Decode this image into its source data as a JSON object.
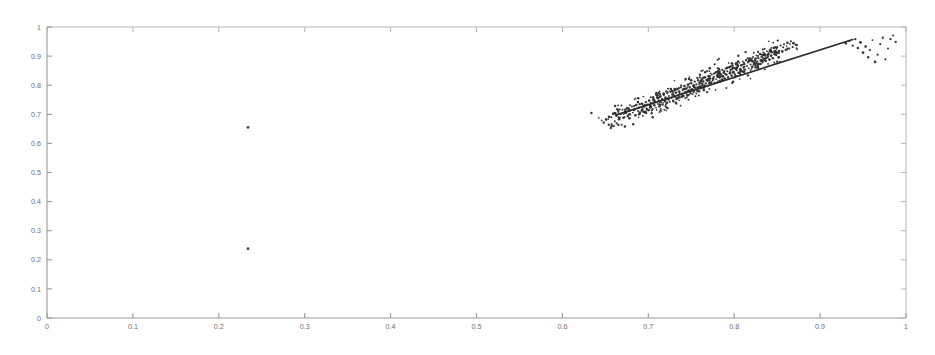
{
  "chart_data": {
    "type": "scatter",
    "title": "",
    "subtitle": "",
    "xlabel": "",
    "ylabel": "",
    "xlim": [
      0,
      1
    ],
    "ylim": [
      0,
      1
    ],
    "grid": false,
    "legend": null,
    "x_ticks": [
      0,
      0.1,
      0.2,
      0.3,
      0.4,
      0.5,
      0.6,
      0.7,
      0.8,
      0.9,
      1
    ],
    "y_ticks": [
      0,
      0.1,
      0.2,
      0.3,
      0.4,
      0.5,
      0.6,
      0.7,
      0.8,
      0.9,
      1
    ],
    "x_tick_labels": [
      "0",
      "0.1",
      "0.2",
      "0.3",
      "0.4",
      "0.5",
      "0.6",
      "0.7",
      "0.8",
      "0.9",
      "1"
    ],
    "y_tick_labels": [
      "0",
      "0.1",
      "0.2",
      "0.3",
      "0.4",
      "0.5",
      "0.6",
      "0.7",
      "0.8",
      "0.9",
      "1"
    ],
    "marker_color": "#333333",
    "line_color": "#2a2a2a",
    "axis_color": "#9a9a9a",
    "background_color": "#ffffff",
    "fit_line": {
      "name": "regression-line",
      "x0": 0.662,
      "y0": 0.697,
      "x1": 0.938,
      "y1": 0.957,
      "slope": 0.942,
      "intercept": 0.073
    },
    "series": [
      {
        "name": "main-cluster",
        "points": [
          [
            0.648,
            0.672
          ],
          [
            0.651,
            0.681
          ],
          [
            0.654,
            0.664
          ],
          [
            0.657,
            0.69
          ],
          [
            0.659,
            0.702
          ],
          [
            0.661,
            0.676
          ],
          [
            0.663,
            0.694
          ],
          [
            0.665,
            0.709
          ],
          [
            0.666,
            0.683
          ],
          [
            0.668,
            0.701
          ],
          [
            0.67,
            0.716
          ],
          [
            0.671,
            0.688
          ],
          [
            0.673,
            0.705
          ],
          [
            0.675,
            0.722
          ],
          [
            0.676,
            0.694
          ],
          [
            0.678,
            0.712
          ],
          [
            0.679,
            0.7
          ],
          [
            0.681,
            0.727
          ],
          [
            0.682,
            0.706
          ],
          [
            0.684,
            0.718
          ],
          [
            0.685,
            0.697
          ],
          [
            0.686,
            0.732
          ],
          [
            0.688,
            0.711
          ],
          [
            0.689,
            0.723
          ],
          [
            0.69,
            0.703
          ],
          [
            0.692,
            0.737
          ],
          [
            0.693,
            0.716
          ],
          [
            0.694,
            0.728
          ],
          [
            0.696,
            0.708
          ],
          [
            0.697,
            0.742
          ],
          [
            0.698,
            0.721
          ],
          [
            0.699,
            0.733
          ],
          [
            0.7,
            0.713
          ],
          [
            0.701,
            0.747
          ],
          [
            0.703,
            0.726
          ],
          [
            0.704,
            0.738
          ],
          [
            0.705,
            0.718
          ],
          [
            0.706,
            0.752
          ],
          [
            0.707,
            0.731
          ],
          [
            0.708,
            0.743
          ],
          [
            0.709,
            0.723
          ],
          [
            0.71,
            0.757
          ],
          [
            0.711,
            0.736
          ],
          [
            0.712,
            0.748
          ],
          [
            0.713,
            0.728
          ],
          [
            0.714,
            0.762
          ],
          [
            0.715,
            0.741
          ],
          [
            0.716,
            0.753
          ],
          [
            0.717,
            0.733
          ],
          [
            0.718,
            0.767
          ],
          [
            0.719,
            0.746
          ],
          [
            0.72,
            0.758
          ],
          [
            0.721,
            0.738
          ],
          [
            0.722,
            0.772
          ],
          [
            0.723,
            0.751
          ],
          [
            0.724,
            0.763
          ],
          [
            0.725,
            0.743
          ],
          [
            0.726,
            0.777
          ],
          [
            0.727,
            0.756
          ],
          [
            0.728,
            0.768
          ],
          [
            0.729,
            0.748
          ],
          [
            0.73,
            0.782
          ],
          [
            0.731,
            0.761
          ],
          [
            0.732,
            0.773
          ],
          [
            0.733,
            0.753
          ],
          [
            0.734,
            0.787
          ],
          [
            0.735,
            0.766
          ],
          [
            0.736,
            0.778
          ],
          [
            0.737,
            0.758
          ],
          [
            0.738,
            0.792
          ],
          [
            0.739,
            0.771
          ],
          [
            0.74,
            0.783
          ],
          [
            0.741,
            0.763
          ],
          [
            0.742,
            0.797
          ],
          [
            0.743,
            0.776
          ],
          [
            0.744,
            0.788
          ],
          [
            0.745,
            0.768
          ],
          [
            0.746,
            0.802
          ],
          [
            0.747,
            0.781
          ],
          [
            0.748,
            0.793
          ],
          [
            0.749,
            0.773
          ],
          [
            0.75,
            0.807
          ],
          [
            0.751,
            0.786
          ],
          [
            0.752,
            0.798
          ],
          [
            0.753,
            0.778
          ],
          [
            0.754,
            0.812
          ],
          [
            0.755,
            0.791
          ],
          [
            0.756,
            0.803
          ],
          [
            0.757,
            0.783
          ],
          [
            0.758,
            0.817
          ],
          [
            0.759,
            0.796
          ],
          [
            0.76,
            0.808
          ],
          [
            0.761,
            0.788
          ],
          [
            0.762,
            0.822
          ],
          [
            0.763,
            0.801
          ],
          [
            0.764,
            0.813
          ],
          [
            0.765,
            0.793
          ],
          [
            0.766,
            0.827
          ],
          [
            0.767,
            0.806
          ],
          [
            0.768,
            0.818
          ],
          [
            0.769,
            0.798
          ],
          [
            0.77,
            0.832
          ],
          [
            0.771,
            0.811
          ],
          [
            0.772,
            0.823
          ],
          [
            0.773,
            0.803
          ],
          [
            0.774,
            0.837
          ],
          [
            0.775,
            0.816
          ],
          [
            0.776,
            0.828
          ],
          [
            0.777,
            0.808
          ],
          [
            0.778,
            0.842
          ],
          [
            0.779,
            0.821
          ],
          [
            0.78,
            0.833
          ],
          [
            0.781,
            0.813
          ],
          [
            0.782,
            0.847
          ],
          [
            0.783,
            0.826
          ],
          [
            0.784,
            0.838
          ],
          [
            0.785,
            0.818
          ],
          [
            0.786,
            0.852
          ],
          [
            0.787,
            0.831
          ],
          [
            0.788,
            0.843
          ],
          [
            0.789,
            0.823
          ],
          [
            0.79,
            0.857
          ],
          [
            0.791,
            0.836
          ],
          [
            0.792,
            0.848
          ],
          [
            0.793,
            0.828
          ],
          [
            0.794,
            0.862
          ],
          [
            0.795,
            0.841
          ],
          [
            0.796,
            0.853
          ],
          [
            0.797,
            0.833
          ],
          [
            0.798,
            0.867
          ],
          [
            0.799,
            0.846
          ],
          [
            0.8,
            0.858
          ],
          [
            0.801,
            0.838
          ],
          [
            0.802,
            0.872
          ],
          [
            0.803,
            0.851
          ],
          [
            0.804,
            0.863
          ],
          [
            0.805,
            0.843
          ],
          [
            0.806,
            0.877
          ],
          [
            0.807,
            0.856
          ],
          [
            0.808,
            0.868
          ],
          [
            0.809,
            0.848
          ],
          [
            0.81,
            0.882
          ],
          [
            0.811,
            0.861
          ],
          [
            0.812,
            0.873
          ],
          [
            0.813,
            0.853
          ],
          [
            0.814,
            0.887
          ],
          [
            0.815,
            0.866
          ],
          [
            0.816,
            0.878
          ],
          [
            0.817,
            0.858
          ],
          [
            0.818,
            0.892
          ],
          [
            0.819,
            0.871
          ],
          [
            0.82,
            0.883
          ],
          [
            0.821,
            0.863
          ],
          [
            0.822,
            0.897
          ],
          [
            0.823,
            0.876
          ],
          [
            0.824,
            0.888
          ],
          [
            0.825,
            0.868
          ],
          [
            0.826,
            0.902
          ],
          [
            0.827,
            0.881
          ],
          [
            0.828,
            0.893
          ],
          [
            0.829,
            0.873
          ],
          [
            0.83,
            0.907
          ],
          [
            0.831,
            0.886
          ],
          [
            0.832,
            0.898
          ],
          [
            0.833,
            0.878
          ],
          [
            0.834,
            0.912
          ],
          [
            0.835,
            0.891
          ],
          [
            0.836,
            0.903
          ],
          [
            0.837,
            0.883
          ],
          [
            0.838,
            0.917
          ],
          [
            0.839,
            0.896
          ],
          [
            0.84,
            0.908
          ],
          [
            0.841,
            0.888
          ],
          [
            0.842,
            0.922
          ],
          [
            0.843,
            0.901
          ],
          [
            0.844,
            0.913
          ],
          [
            0.845,
            0.893
          ],
          [
            0.846,
            0.927
          ],
          [
            0.847,
            0.906
          ],
          [
            0.848,
            0.918
          ],
          [
            0.85,
            0.931
          ],
          [
            0.852,
            0.911
          ],
          [
            0.854,
            0.936
          ],
          [
            0.856,
            0.916
          ],
          [
            0.858,
            0.941
          ],
          [
            0.86,
            0.921
          ],
          [
            0.862,
            0.946
          ],
          [
            0.864,
            0.926
          ],
          [
            0.866,
            0.951
          ],
          [
            0.868,
            0.931
          ]
        ]
      },
      {
        "name": "detached-right-group",
        "points": [
          [
            0.93,
            0.944
          ],
          [
            0.934,
            0.952
          ],
          [
            0.938,
            0.936
          ],
          [
            0.941,
            0.958
          ],
          [
            0.944,
            0.928
          ],
          [
            0.947,
            0.947
          ],
          [
            0.95,
            0.912
          ],
          [
            0.953,
            0.933
          ],
          [
            0.956,
            0.896
          ],
          [
            0.958,
            0.921
          ],
          [
            0.961,
            0.955
          ],
          [
            0.964,
            0.88
          ],
          [
            0.967,
            0.905
          ],
          [
            0.97,
            0.941
          ],
          [
            0.973,
            0.963
          ],
          [
            0.976,
            0.889
          ],
          [
            0.979,
            0.926
          ],
          [
            0.982,
            0.958
          ],
          [
            0.985,
            0.971
          ],
          [
            0.988,
            0.949
          ]
        ]
      },
      {
        "name": "isolated-outliers",
        "points": [
          [
            0.234,
            0.655
          ],
          [
            0.234,
            0.238
          ]
        ]
      }
    ],
    "n_points_main": 190,
    "n_points_detached": 20,
    "n_outliers": 2
  }
}
